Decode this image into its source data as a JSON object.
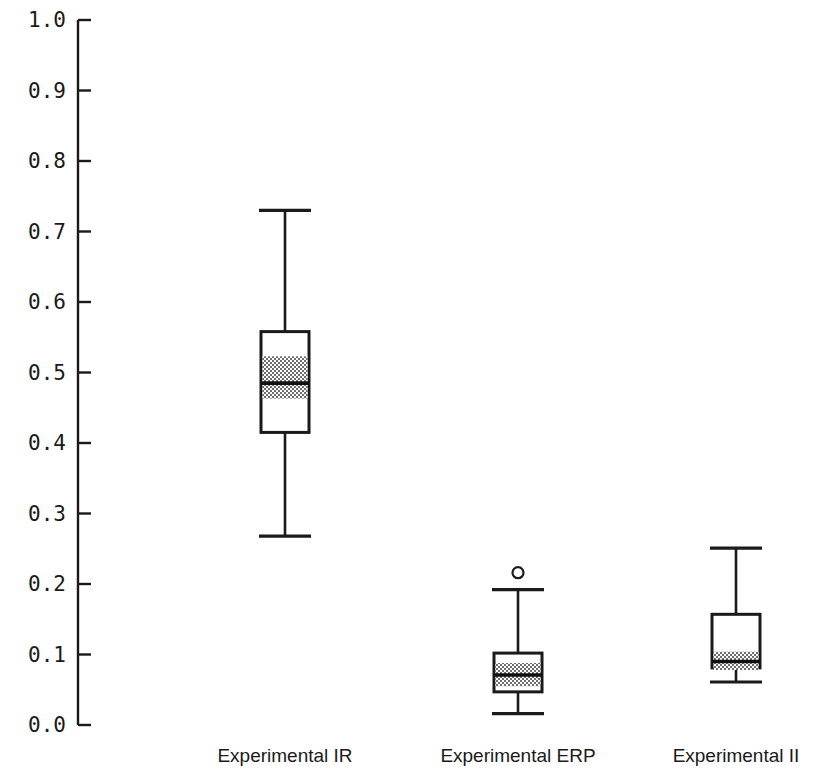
{
  "chart_data": {
    "type": "box",
    "title": "",
    "xlabel": "",
    "ylabel": "",
    "ylim": [
      0.0,
      1.0
    ],
    "grid": false,
    "legend": "none",
    "categories": [
      "Experimental IR",
      "Experimental ERP",
      "Experimental II"
    ],
    "ytick_labels": [
      "1.0",
      "0.9",
      "0.8",
      "0.7",
      "0.6",
      "0.5",
      "0.4",
      "0.3",
      "0.2",
      "0.1",
      "0.0"
    ],
    "ytick_values": [
      1.0,
      0.9,
      0.8,
      0.7,
      0.6,
      0.5,
      0.4,
      0.3,
      0.2,
      0.1,
      0.0
    ],
    "boxes": [
      {
        "name": "Experimental IR",
        "whisker_low": 0.268,
        "q1": 0.415,
        "median": 0.485,
        "q3": 0.558,
        "whisker_high": 0.73,
        "notch_low": 0.463,
        "notch_high": 0.523,
        "outliers": []
      },
      {
        "name": "Experimental ERP",
        "whisker_low": 0.016,
        "q1": 0.047,
        "median": 0.071,
        "q3": 0.102,
        "whisker_high": 0.192,
        "notch_low": 0.055,
        "notch_high": 0.088,
        "outliers": [
          0.216
        ]
      },
      {
        "name": "Experimental II",
        "whisker_low": 0.061,
        "q1": 0.081,
        "median": 0.09,
        "q3": 0.157,
        "whisker_high": 0.251,
        "notch_low": 0.078,
        "notch_high": 0.104,
        "outliers": []
      }
    ]
  },
  "colors": {
    "background": "#ffffff",
    "ink": "#1a1a1a",
    "box_fill": "#ffffff",
    "notch_fill": "#8c8c8c"
  },
  "geometry": {
    "axis_x": 78,
    "axis_top_y": 20,
    "axis_bottom_y": 725,
    "tick_len": 13,
    "tick_label_x": 66,
    "box_half_width": 24,
    "cap_half_width": 26,
    "label_y": 748,
    "centers_x": [
      285,
      518,
      736
    ]
  }
}
